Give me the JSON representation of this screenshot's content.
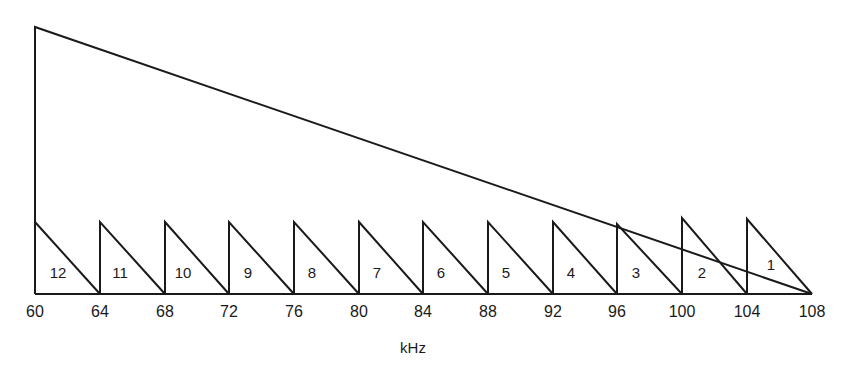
{
  "diagram": {
    "axis_label": "kHz",
    "ticks": [
      "60",
      "64",
      "68",
      "72",
      "76",
      "80",
      "84",
      "88",
      "92",
      "96",
      "100",
      "104",
      "108"
    ],
    "channels": [
      {
        "label": "12",
        "x_from": 60,
        "x_to": 64
      },
      {
        "label": "11",
        "x_from": 64,
        "x_to": 68
      },
      {
        "label": "10",
        "x_from": 68,
        "x_to": 72
      },
      {
        "label": "9",
        "x_from": 72,
        "x_to": 76
      },
      {
        "label": "8",
        "x_from": 76,
        "x_to": 80
      },
      {
        "label": "7",
        "x_from": 80,
        "x_to": 84
      },
      {
        "label": "6",
        "x_from": 84,
        "x_to": 88
      },
      {
        "label": "5",
        "x_from": 88,
        "x_to": 92
      },
      {
        "label": "4",
        "x_from": 92,
        "x_to": 96
      },
      {
        "label": "3",
        "x_from": 96,
        "x_to": 100
      },
      {
        "label": "2",
        "x_from": 100,
        "x_to": 104
      },
      {
        "label": "1",
        "x_from": 104,
        "x_to": 108
      }
    ],
    "group_band": {
      "x_from": 60,
      "x_to": 108
    }
  }
}
